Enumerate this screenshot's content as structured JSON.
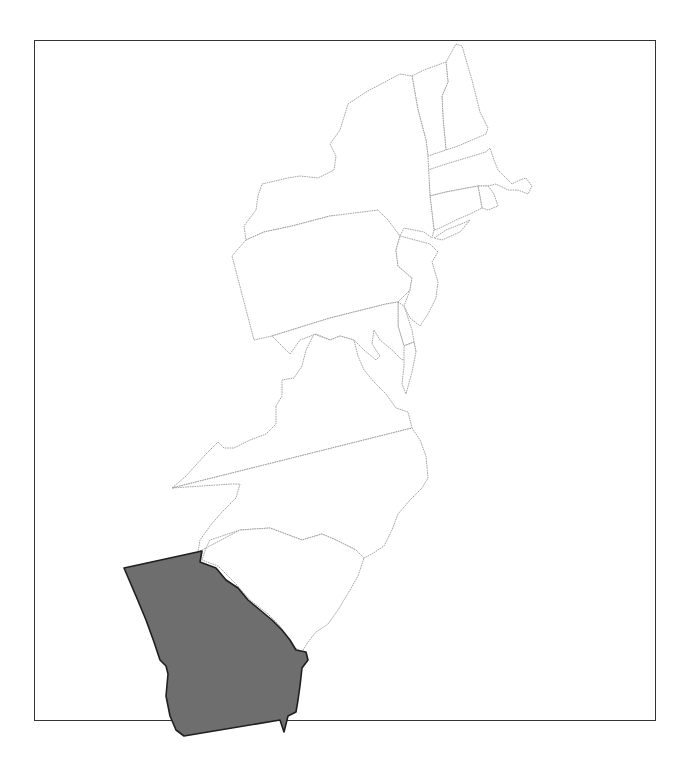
{
  "map": {
    "title": "",
    "subject": "Thirteen original colonies (eastern seaboard)",
    "frame": {
      "border_color": "#333333",
      "background": "#ffffff"
    },
    "highlighted_region": {
      "name": "Georgia",
      "fill": "#6e6e6e",
      "stroke": "#1f1f1f"
    },
    "regions": [
      {
        "id": "new-hampshire",
        "name": "New Hampshire",
        "highlighted": false
      },
      {
        "id": "massachusetts",
        "name": "Massachusetts",
        "highlighted": false
      },
      {
        "id": "rhode-island",
        "name": "Rhode Island",
        "highlighted": false
      },
      {
        "id": "connecticut",
        "name": "Connecticut",
        "highlighted": false
      },
      {
        "id": "new-york",
        "name": "New York",
        "highlighted": false
      },
      {
        "id": "new-jersey",
        "name": "New Jersey",
        "highlighted": false
      },
      {
        "id": "pennsylvania",
        "name": "Pennsylvania",
        "highlighted": false
      },
      {
        "id": "delaware",
        "name": "Delaware",
        "highlighted": false
      },
      {
        "id": "maryland",
        "name": "Maryland",
        "highlighted": false
      },
      {
        "id": "virginia",
        "name": "Virginia",
        "highlighted": false
      },
      {
        "id": "north-carolina",
        "name": "North Carolina",
        "highlighted": false
      },
      {
        "id": "south-carolina",
        "name": "South Carolina",
        "highlighted": false
      },
      {
        "id": "georgia",
        "name": "Georgia",
        "highlighted": true
      }
    ],
    "outline_color": "#9a9a9a"
  }
}
